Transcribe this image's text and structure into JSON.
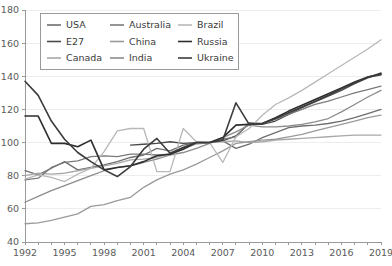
{
  "chart_data": {
    "type": "line",
    "title": "",
    "subtitle": "",
    "xlabel": "",
    "ylabel": "",
    "xlim": [
      1992,
      2019
    ],
    "ylim": [
      40,
      180
    ],
    "yticks": [
      40,
      60,
      80,
      100,
      120,
      140,
      160,
      180
    ],
    "xticks": [
      1992,
      1995,
      1998,
      2001,
      2004,
      2007,
      2010,
      2013,
      2016,
      2019
    ],
    "grid": "horizontal",
    "legend_position": "top-left",
    "x": [
      1992,
      1993,
      1994,
      1995,
      1996,
      1997,
      1998,
      1999,
      2000,
      2001,
      2002,
      2003,
      2004,
      2005,
      2006,
      2007,
      2008,
      2009,
      2010,
      2011,
      2012,
      2013,
      2014,
      2015,
      2016,
      2017,
      2018,
      2019
    ],
    "series": [
      {
        "name": "USA",
        "color": "#6e6e6e",
        "width": 1.3,
        "values": [
          83.0,
          80.5,
          84.5,
          88.5,
          83.5,
          85.0,
          86.5,
          88.5,
          91.0,
          92.5,
          96.5,
          95.0,
          98.5,
          100.0,
          100.0,
          101.0,
          96.5,
          99.0,
          103.0,
          106.0,
          109.0,
          110.0,
          110.5,
          111.5,
          113.0,
          115.0,
          117.5,
          120.0
        ]
      },
      {
        "name": "E27",
        "color": "#4a4a4a",
        "width": 1.3,
        "values": [
          null,
          null,
          null,
          null,
          null,
          null,
          null,
          null,
          98.5,
          99.0,
          99.5,
          100.5,
          99.5,
          100.0,
          100.0,
          101.0,
          104.0,
          111.5,
          111.0,
          113.0,
          117.0,
          121.0,
          124.5,
          128.0,
          131.5,
          135.5,
          139.0,
          142.0
        ]
      },
      {
        "name": "Canada",
        "color": "#a8a8a8",
        "width": 1.3,
        "values": [
          80.0,
          81.5,
          81.0,
          81.5,
          83.0,
          84.5,
          86.0,
          87.5,
          89.5,
          90.0,
          91.0,
          93.5,
          96.5,
          99.0,
          100.0,
          100.5,
          101.0,
          100.0,
          100.5,
          101.5,
          102.0,
          102.5,
          103.0,
          103.5,
          104.0,
          104.5,
          104.5,
          104.5
        ]
      },
      {
        "name": "Australia",
        "color": "#7a7a7a",
        "width": 1.3,
        "values": [
          77.5,
          78.5,
          85.0,
          88.0,
          89.0,
          91.5,
          92.0,
          91.5,
          93.0,
          93.0,
          92.5,
          93.0,
          97.0,
          100.0,
          100.0,
          102.0,
          103.5,
          112.0,
          111.5,
          114.0,
          117.0,
          120.0,
          123.0,
          125.0,
          127.5,
          130.0,
          132.0,
          134.0
        ]
      },
      {
        "name": "China",
        "color": "#9a9a9a",
        "width": 1.3,
        "values": [
          51.0,
          51.5,
          53.0,
          55.0,
          57.0,
          61.5,
          62.5,
          65.0,
          67.0,
          73.0,
          77.5,
          81.0,
          83.5,
          87.0,
          91.0,
          95.0,
          99.5,
          100.5,
          101.5,
          102.0,
          103.5,
          105.0,
          107.0,
          109.0,
          111.0,
          113.0,
          115.0,
          116.5
        ]
      },
      {
        "name": "India",
        "color": "#8c8c8c",
        "width": 1.3,
        "values": [
          64.0,
          67.5,
          71.0,
          74.0,
          77.0,
          80.0,
          83.0,
          85.0,
          86.0,
          88.0,
          90.0,
          92.5,
          94.0,
          96.5,
          99.5,
          103.0,
          106.5,
          110.5,
          109.5,
          109.5,
          110.0,
          111.0,
          112.5,
          114.5,
          118.5,
          123.0,
          127.5,
          131.5
        ]
      },
      {
        "name": "Brazil",
        "color": "#b8b8b8",
        "width": 1.3,
        "values": [
          78.0,
          80.5,
          79.0,
          76.5,
          81.0,
          84.5,
          94.5,
          107.0,
          108.5,
          108.5,
          82.5,
          82.5,
          108.5,
          100.5,
          100.0,
          88.0,
          103.5,
          108.5,
          116.5,
          123.0,
          127.0,
          131.5,
          136.5,
          141.5,
          146.5,
          151.5,
          156.5,
          162.0
        ]
      },
      {
        "name": "Russia",
        "color": "#2e2e2e",
        "width": 1.6,
        "values": [
          116.0,
          116.0,
          99.5,
          99.5,
          97.5,
          101.5,
          83.5,
          85.0,
          86.0,
          88.5,
          92.0,
          93.0,
          96.0,
          100.0,
          100.0,
          103.0,
          110.5,
          111.0,
          111.5,
          115.0,
          119.0,
          122.5,
          126.0,
          129.5,
          133.0,
          136.5,
          139.5,
          141.5
        ]
      },
      {
        "name": "Ukraine",
        "color": "#3c3c3c",
        "width": 1.6,
        "values": [
          137.0,
          128.5,
          113.0,
          102.0,
          94.0,
          88.5,
          83.5,
          79.5,
          85.5,
          96.0,
          102.5,
          93.5,
          97.0,
          100.0,
          100.0,
          101.5,
          124.0,
          111.0,
          111.5,
          114.5,
          118.0,
          121.5,
          125.0,
          128.5,
          132.5,
          136.0,
          139.5,
          141.0
        ]
      }
    ]
  },
  "legend": {
    "entries": [
      {
        "label": "USA",
        "color": "#6e6e6e"
      },
      {
        "label": "Australia",
        "color": "#7a7a7a"
      },
      {
        "label": "Brazil",
        "color": "#b8b8b8"
      },
      {
        "label": "E27",
        "color": "#4a4a4a"
      },
      {
        "label": "China",
        "color": "#9a9a9a"
      },
      {
        "label": "Russia",
        "color": "#2e2e2e"
      },
      {
        "label": "Canada",
        "color": "#a8a8a8"
      },
      {
        "label": "India",
        "color": "#8c8c8c"
      },
      {
        "label": "Ukraine",
        "color": "#3c3c3c"
      }
    ]
  },
  "axes": {
    "y_tick_labels": [
      "40",
      "60",
      "80",
      "100",
      "120",
      "140",
      "160",
      "180"
    ],
    "x_tick_labels": [
      "1992",
      "1995",
      "1998",
      "2001",
      "2004",
      "2007",
      "2010",
      "2013",
      "2016",
      "2019"
    ]
  }
}
